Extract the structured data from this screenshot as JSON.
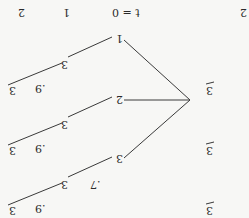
{
  "orientation": "rotated-180",
  "header": {
    "col_t0": "t = 0",
    "col_1": "1",
    "col_2a": "2",
    "col_2b": "2"
  },
  "root": {
    "label": ""
  },
  "branches": [
    {
      "node": "1",
      "mid": "3",
      "mid_prob": "",
      "leaf": "3",
      "leaf_prob": ".9",
      "right": "3"
    },
    {
      "node": "2",
      "mid": "3",
      "mid_prob": "",
      "leaf": "3",
      "leaf_prob": ".9",
      "right": "3"
    },
    {
      "node": "3",
      "mid": "3",
      "mid_prob": ".7",
      "leaf": "3",
      "leaf_prob": ".9",
      "right": "3"
    }
  ],
  "colors": {
    "line": "#3a3a3a",
    "text": "#2a2a2a",
    "background": "#f7f7f5"
  }
}
